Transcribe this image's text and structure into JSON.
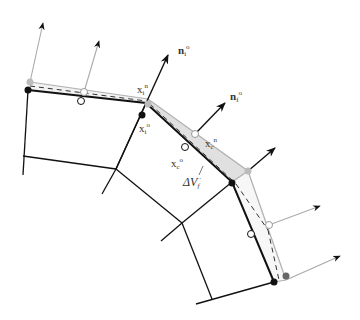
{
  "figure": {
    "labels": {
      "ni": {
        "base": "n",
        "sub": "i",
        "sup": "o"
      },
      "nj": {
        "base": "n",
        "sub": "f",
        "sup": "o"
      },
      "xin": {
        "base": "x",
        "sub": "i",
        "sup": "n"
      },
      "xio": {
        "base": "x",
        "sub": "i",
        "sup": "o"
      },
      "xcn": {
        "base": "x",
        "sub": "c",
        "sup": "n"
      },
      "xco": {
        "base": "x",
        "sub": "c",
        "sup": "o"
      },
      "dv": {
        "base": "ΔV",
        "sub": "f",
        "sup": "·"
      }
    },
    "colors": {
      "old_mesh": "#111111",
      "new_mesh": "#aaaaaa",
      "swept_fill": "#e2e2e2",
      "dashed": "#333333",
      "gray_node": "#bbbbbb",
      "dark_gray_node": "#666666"
    }
  }
}
